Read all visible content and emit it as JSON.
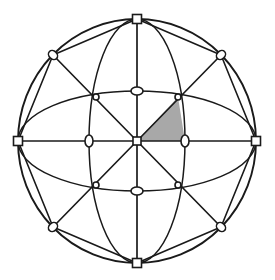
{
  "figure": {
    "type": "geometric-diagram",
    "width": 275,
    "height": 280,
    "background_color": "#ffffff",
    "line_color": "#1a1a1a",
    "shaded_color": "#a8a8a8",
    "marker_fill": "#ffffff",
    "line_width": 1.7,
    "thin_line_width": 1.4
  },
  "geometry": {
    "center": {
      "x": 137,
      "y": 141
    },
    "outer_circle": {
      "cx": 137,
      "cy": 141,
      "rx": 119,
      "ry": 122
    },
    "inner_ellipse_vertical": {
      "cx": 137,
      "cy": 141,
      "rx": 48,
      "ry": 122
    },
    "inner_ellipse_horizontal": {
      "cx": 137,
      "cy": 141,
      "rx": 119,
      "ry": 50
    }
  },
  "nodes": [
    {
      "id": "center",
      "label": "center",
      "marker": "square",
      "x": 137,
      "y": 141,
      "size": 8
    },
    {
      "id": "north",
      "label": "north-pole",
      "marker": "square",
      "x": 137,
      "y": 19,
      "size": 9
    },
    {
      "id": "south",
      "label": "south-pole",
      "marker": "square",
      "x": 137,
      "y": 263,
      "size": 9
    },
    {
      "id": "east",
      "label": "east-point",
      "marker": "square",
      "x": 256,
      "y": 141,
      "size": 9
    },
    {
      "id": "west",
      "label": "west-point",
      "marker": "square",
      "x": 18,
      "y": 141,
      "size": 9
    },
    {
      "id": "ne-outer",
      "label": "northeast-limb",
      "marker": "ellipse",
      "x": 221,
      "y": 55,
      "rx": 5,
      "ry": 4,
      "rot": -45
    },
    {
      "id": "nw-outer",
      "label": "northwest-limb",
      "marker": "ellipse",
      "x": 53,
      "y": 55,
      "rx": 5,
      "ry": 4,
      "rot": 45
    },
    {
      "id": "se-outer",
      "label": "southeast-limb",
      "marker": "ellipse",
      "x": 221,
      "y": 227,
      "rx": 5,
      "ry": 4,
      "rot": 45
    },
    {
      "id": "sw-outer",
      "label": "southwest-limb",
      "marker": "ellipse",
      "x": 53,
      "y": 227,
      "rx": 5,
      "ry": 4,
      "rot": -45
    },
    {
      "id": "north-arc",
      "label": "north-arc-crossing",
      "marker": "ellipse",
      "x": 137,
      "y": 91,
      "rx": 6,
      "ry": 4,
      "rot": 0
    },
    {
      "id": "south-arc",
      "label": "south-arc-crossing",
      "marker": "ellipse",
      "x": 137,
      "y": 191,
      "rx": 6,
      "ry": 4,
      "rot": 0
    },
    {
      "id": "east-arc",
      "label": "east-arc-crossing",
      "marker": "ellipse",
      "x": 185,
      "y": 141,
      "rx": 4,
      "ry": 6,
      "rot": 0
    },
    {
      "id": "west-arc",
      "label": "west-arc-crossing",
      "marker": "ellipse",
      "x": 89,
      "y": 141,
      "rx": 4,
      "ry": 6,
      "rot": 0
    },
    {
      "id": "ne-inner",
      "label": "northeast-inner-node",
      "marker": "dot",
      "x": 178,
      "y": 97,
      "size": 3
    },
    {
      "id": "nw-inner",
      "label": "northwest-inner-node",
      "marker": "dot",
      "x": 96,
      "y": 97,
      "size": 3
    },
    {
      "id": "se-inner",
      "label": "southeast-inner-node",
      "marker": "dot",
      "x": 178,
      "y": 185,
      "size": 3
    },
    {
      "id": "sw-inner",
      "label": "southwest-inner-node",
      "marker": "dot",
      "x": 96,
      "y": 185,
      "size": 3
    }
  ],
  "shaded_region": {
    "label": "highlighted-octant-face",
    "fill": "#a8a8a8",
    "vertices": [
      {
        "x": 137,
        "y": 141
      },
      {
        "x": 178,
        "y": 97
      },
      {
        "x": 185,
        "y": 141
      }
    ]
  },
  "spokes": [
    {
      "label": "spoke-north",
      "to": "north"
    },
    {
      "label": "spoke-northeast",
      "to": "ne-outer"
    },
    {
      "label": "spoke-east",
      "to": "east"
    },
    {
      "label": "spoke-southeast",
      "to": "se-outer"
    },
    {
      "label": "spoke-south",
      "to": "south"
    },
    {
      "label": "spoke-southwest",
      "to": "sw-outer"
    },
    {
      "label": "spoke-west",
      "to": "west"
    },
    {
      "label": "spoke-northwest",
      "to": "nw-outer"
    }
  ],
  "chords": [
    {
      "label": "chord-north-to-ne-limb"
    },
    {
      "label": "chord-north-to-nw-limb"
    },
    {
      "label": "chord-south-to-se-limb"
    },
    {
      "label": "chord-south-to-sw-limb"
    },
    {
      "label": "chord-west-to-nw-limb"
    },
    {
      "label": "chord-west-to-sw-limb"
    },
    {
      "label": "chord-east-to-ne-limb"
    },
    {
      "label": "chord-east-to-se-limb"
    }
  ]
}
